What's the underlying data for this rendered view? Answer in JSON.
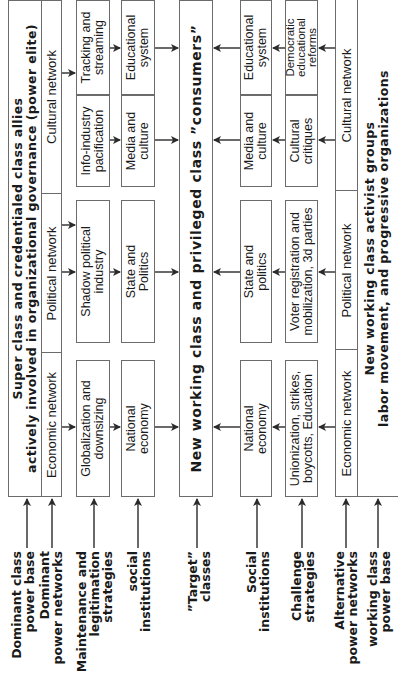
{
  "diagram": {
    "top_group": {
      "title": "Super class and credentialed class allies\nactively involved in organizational governance (power elite)",
      "networks": [
        "Economic network",
        "Political network",
        "Cultural network"
      ]
    },
    "strategies_top": [
      "Globalization  and\ndownsizing",
      "Shadow political\nindustry",
      "Info-industry\npacification",
      "Tracking and\nstreaming"
    ],
    "institutions_top": [
      "National\neconomy",
      "State and\nPolitics",
      "Media and\nculture",
      "Educational\nsystem"
    ],
    "target": "New working class and privileged class ”consumers”",
    "institutions_bottom": [
      "National\neconomy",
      "State and\npolitics",
      "Media and\nculture",
      "Educational\nsystem"
    ],
    "strategies_bottom": [
      "Unionization, strikes,\nboycotts, Education",
      "Voter registration and\nmobilization, 3d parties",
      "Cultural\ncritiques",
      "Democratic\neducational\nreforms"
    ],
    "bottom_group": {
      "networks": [
        "Economic network",
        "Political network",
        "Cultural network"
      ],
      "title": "New working class activist groups\nlabor movement, and progressive organizations"
    },
    "row_labels": [
      "Dominant class\npower base",
      "Dominant\npower networks",
      "Maintenance and\nlegitimation\nstrategies",
      "social\ninstitutions",
      "”Target”\nclasses",
      "Social\ninstitutions",
      "Challenge\nstrategies",
      "Alternative\npower networks",
      "working class\npower base"
    ],
    "colors": {
      "line": "#6b6b6b",
      "text": "#1a1a1a",
      "arrow": "#2a2a2a"
    }
  }
}
